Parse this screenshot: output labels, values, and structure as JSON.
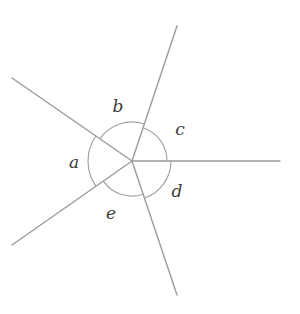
{
  "diagram": {
    "type": "angles-at-a-point",
    "center": [
      132,
      161
    ],
    "line_color": "#9a9a9a",
    "arc_color": "#a3a3a3",
    "label_color": "#3a3a3a",
    "rays": [
      {
        "id": "upper-left",
        "end": [
          12,
          78
        ]
      },
      {
        "id": "top",
        "end": [
          177,
          26
        ]
      },
      {
        "id": "right",
        "end": [
          280,
          161
        ]
      },
      {
        "id": "bottom",
        "end": [
          177,
          295
        ]
      },
      {
        "id": "lower-left",
        "end": [
          12,
          245
        ]
      }
    ],
    "angles": [
      {
        "label": "a",
        "between": [
          "lower-left",
          "upper-left"
        ],
        "arc_radius": 44,
        "label_pos": [
          74,
          162
        ]
      },
      {
        "label": "b",
        "between": [
          "upper-left",
          "top"
        ],
        "arc_radius": 39,
        "label_pos": [
          118,
          106
        ]
      },
      {
        "label": "c",
        "between": [
          "top",
          "right"
        ],
        "arc_radius": 35,
        "label_pos": [
          180,
          129
        ]
      },
      {
        "label": "d",
        "between": [
          "right",
          "bottom"
        ],
        "arc_radius": 39,
        "label_pos": [
          177,
          191
        ]
      },
      {
        "label": "e",
        "between": [
          "bottom",
          "lower-left"
        ],
        "arc_radius": 35,
        "label_pos": [
          111,
          213
        ]
      }
    ]
  }
}
